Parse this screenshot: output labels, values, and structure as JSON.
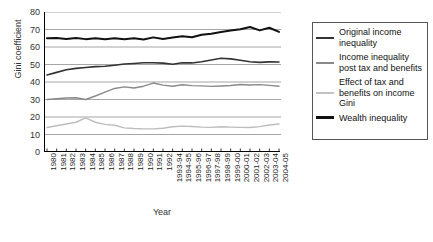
{
  "chart_data": {
    "type": "line",
    "title": "",
    "xlabel": "Year",
    "ylabel": "Gini coefficient",
    "ylim": [
      0,
      80
    ],
    "yticks": [
      0,
      10,
      20,
      30,
      40,
      50,
      60,
      70,
      80
    ],
    "grid": true,
    "legend_position": "right",
    "categories": [
      "1980",
      "1981",
      "1982",
      "1983",
      "1984",
      "1985",
      "1986",
      "1987",
      "1988",
      "1989",
      "1990",
      "1991",
      "1992",
      "1993-94",
      "1994-95",
      "1995-96",
      "1996-97",
      "1997-98",
      "1998-99",
      "1999-00",
      "2000-01",
      "2001-02",
      "2002-03",
      "2003-04",
      "2004-05"
    ],
    "series": [
      {
        "name": "Wealth inequality",
        "color": "#111111",
        "width": 2.0,
        "values": [
          65.0,
          65.2,
          64.6,
          65.1,
          64.5,
          65.0,
          64.4,
          65.0,
          64.4,
          65.0,
          64.3,
          65.5,
          64.6,
          65.4,
          66.2,
          65.6,
          67.0,
          67.6,
          68.6,
          69.4,
          70.2,
          71.4,
          69.5,
          71.0,
          68.6
        ]
      },
      {
        "name": "Original income inequality",
        "color": "#333333",
        "width": 1.6,
        "values": [
          44.0,
          45.5,
          47.0,
          47.8,
          48.3,
          48.8,
          49.0,
          49.6,
          50.3,
          50.6,
          51.0,
          51.0,
          50.8,
          50.1,
          51.0,
          50.9,
          51.6,
          52.6,
          53.6,
          53.2,
          52.4,
          51.6,
          51.2,
          51.5,
          51.4
        ]
      },
      {
        "name": "Income inequality post tax and benefits",
        "color": "#8a8a8a",
        "width": 1.4,
        "values": [
          30.0,
          30.4,
          30.9,
          31.0,
          30.0,
          32.0,
          34.2,
          36.3,
          37.2,
          36.6,
          37.6,
          39.4,
          38.2,
          37.6,
          38.4,
          37.9,
          37.8,
          37.5,
          37.7,
          38.0,
          38.6,
          38.3,
          38.5,
          38.1,
          37.6
        ]
      },
      {
        "name": "Effect of tax and benefits on income Gini",
        "color": "#bdbdbd",
        "width": 1.4,
        "values": [
          14.0,
          15.0,
          16.0,
          17.0,
          19.5,
          17.0,
          15.8,
          15.3,
          13.8,
          13.4,
          13.2,
          13.2,
          13.6,
          14.4,
          14.8,
          14.6,
          14.2,
          14.1,
          14.4,
          14.2,
          14.1,
          14.0,
          14.5,
          15.4,
          16.0
        ]
      }
    ]
  },
  "legend": {
    "items": [
      {
        "label": "Original income inequality",
        "color": "#333333",
        "thickness": "2px"
      },
      {
        "label": "Income inequality post tax and benefits",
        "color": "#8a8a8a",
        "thickness": "2px"
      },
      {
        "label": "Effect of tax and benefits on income Gini",
        "color": "#c2c2c2",
        "thickness": "2px"
      },
      {
        "label": "Wealth inequality",
        "color": "#111111",
        "thickness": "3px"
      }
    ]
  }
}
